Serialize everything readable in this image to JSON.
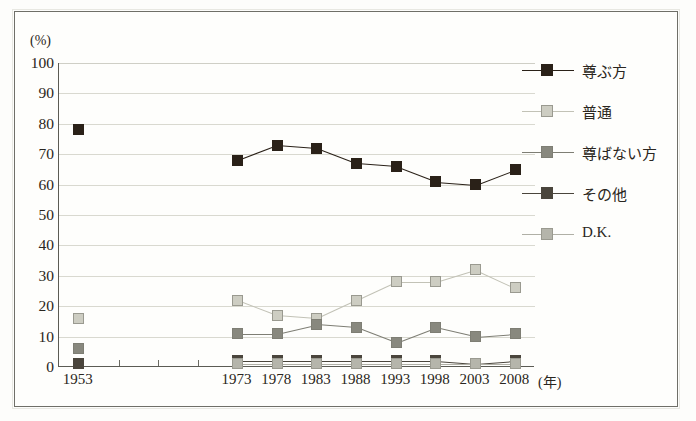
{
  "chart_data": {
    "type": "line",
    "title": "",
    "xlabel": "(年)",
    "ylabel": "(%)",
    "ylim": [
      0,
      100
    ],
    "ytick_step": 10,
    "grid": true,
    "legend_position": "right",
    "x_axis_unit": "(年)",
    "y_axis_unit": "(%)",
    "categories": [
      "1953",
      "1973",
      "1978",
      "1983",
      "1988",
      "1993",
      "1998",
      "2003",
      "2008"
    ],
    "yticks": [
      "0",
      "10",
      "20",
      "30",
      "40",
      "50",
      "60",
      "70",
      "80",
      "90",
      "100"
    ],
    "series": [
      {
        "name": "尊ぶ方",
        "color": "#2a2118",
        "line_color": "#2a2118",
        "values": [
          78,
          68,
          73,
          72,
          67,
          66,
          61,
          60,
          65
        ],
        "connect_from_index": 1
      },
      {
        "name": "普通",
        "color": "#cdcdc2",
        "line_color": "#c2c2b6",
        "values": [
          16,
          22,
          17,
          16,
          22,
          28,
          28,
          32,
          26
        ],
        "connect_from_index": 1
      },
      {
        "name": "尊ばない方",
        "color": "#88887e",
        "line_color": "#7e7e74",
        "values": [
          6,
          11,
          11,
          14,
          13,
          8,
          13,
          10,
          11
        ],
        "connect_from_index": 1
      },
      {
        "name": "その他",
        "color": "#4a453c",
        "line_color": "#4a453c",
        "values": [
          1,
          2,
          2,
          2,
          2,
          2,
          2,
          1,
          2
        ],
        "connect_from_index": 1
      },
      {
        "name": "D.K.",
        "color": "#b5b5ab",
        "line_color": "#b0b0a6",
        "values": [
          null,
          1,
          1,
          1,
          1,
          1,
          1,
          1,
          1
        ],
        "connect_from_index": 1
      }
    ]
  }
}
